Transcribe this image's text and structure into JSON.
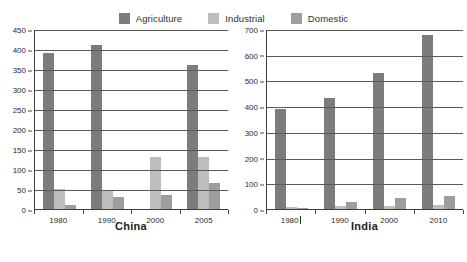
{
  "legend": {
    "position": "top-center",
    "items": [
      {
        "label": "Agriculture",
        "color": "#7c7c7c",
        "icon": "legend-swatch-agriculture"
      },
      {
        "label": "Industrial",
        "color": "#bdbdbd",
        "icon": "legend-swatch-industrial"
      },
      {
        "label": "Domestic",
        "color": "#9d9d9d",
        "icon": "legend-swatch-domestic"
      }
    ]
  },
  "chart_data": [
    {
      "type": "bar",
      "title": "China",
      "xlabel": "",
      "ylabel": "",
      "categories": [
        "1980",
        "1990",
        "2000",
        "2005"
      ],
      "series": [
        {
          "name": "Agriculture",
          "color": "#7c7c7c",
          "values": [
            390,
            410,
            0,
            360
          ]
        },
        {
          "name": "Industrial",
          "color": "#bdbdbd",
          "values": [
            50,
            48,
            130,
            130
          ]
        },
        {
          "name": "Domestic",
          "color": "#9d9d9d",
          "values": [
            10,
            30,
            35,
            65
          ]
        }
      ],
      "ylim": [
        0,
        450
      ],
      "yticks": [
        0,
        50,
        100,
        150,
        200,
        250,
        300,
        350,
        400,
        450
      ],
      "grid": true,
      "legend": "shared-top"
    },
    {
      "type": "bar",
      "title": "India",
      "xlabel": "",
      "ylabel": "",
      "categories": [
        "1980",
        "1990",
        "2000",
        "2010"
      ],
      "series": [
        {
          "name": "Agriculture",
          "color": "#7c7c7c",
          "values": [
            390,
            430,
            530,
            675
          ]
        },
        {
          "name": "Industrial",
          "color": "#bdbdbd",
          "values": [
            8,
            10,
            12,
            15
          ]
        },
        {
          "name": "Domestic",
          "color": "#9d9d9d",
          "values": [
            5,
            28,
            42,
            50
          ]
        }
      ],
      "ylim": [
        0,
        700
      ],
      "yticks": [
        0,
        100,
        200,
        300,
        400,
        500,
        600,
        700
      ],
      "grid": true,
      "legend": "shared-top"
    }
  ]
}
